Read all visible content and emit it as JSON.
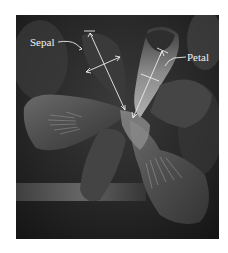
{
  "figure": {
    "labels": {
      "sepal": "Sepal",
      "petal": "Petal"
    },
    "measurements": [
      {
        "name": "sepal-length",
        "description": "Sepal length arrow"
      },
      {
        "name": "sepal-width",
        "description": "Sepal width arrow"
      },
      {
        "name": "petal-length",
        "description": "Petal length arrow"
      },
      {
        "name": "petal-width",
        "description": "Petal width arrow"
      }
    ],
    "colors": {
      "background": "#ffffff",
      "photo_dark": "#1e1e1e",
      "annotation": "#ececec"
    }
  }
}
